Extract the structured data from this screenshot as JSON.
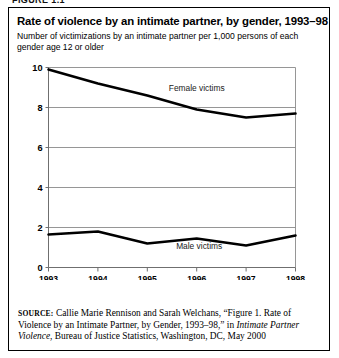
{
  "figure_header": "FIGURE 1.1",
  "figure": {
    "title": "Rate of violence by an intimate partner, by gender, 1993–98",
    "subtitle": "Number of victimizations by an intimate partner per 1,000 persons of each gender age 12 or older"
  },
  "source": {
    "kicker": "source:",
    "part1": " Callie Marie Rennison and Sarah Welchans, “Figure 1. Rate of Violence by an Intimate Partner, by Gender, 1993–98,” in ",
    "italic1": "Intimate Partner Violence",
    "part2": ", Bureau of Justice Statistics, Washington, DC, May 2000"
  },
  "chart_data": {
    "type": "line",
    "title": "Rate of violence by an intimate partner, by gender, 1993–98",
    "subtitle": "Number of victimizations by an intimate partner per 1,000 persons of each gender age 12 or older",
    "xlabel": "",
    "ylabel": "",
    "x": [
      1993,
      1994,
      1995,
      1996,
      1997,
      1998
    ],
    "categories": [
      "1993",
      "1994",
      "1995",
      "1996",
      "1997",
      "1998"
    ],
    "xlim": [
      1993,
      1998
    ],
    "ylim": [
      0,
      10
    ],
    "yticks": [
      0,
      2,
      4,
      6,
      8,
      10
    ],
    "ytick_labels": [
      "0",
      "2",
      "4",
      "6",
      "8",
      "10"
    ],
    "grid": "horizontal",
    "legend": "inline-annotations",
    "series": [
      {
        "name": "Female victims",
        "values": [
          9.9,
          9.2,
          8.6,
          7.9,
          7.5,
          7.7
        ],
        "color": "#000000"
      },
      {
        "name": "Male victims",
        "values": [
          1.65,
          1.8,
          1.2,
          1.45,
          1.1,
          1.6
        ],
        "color": "#000000"
      }
    ],
    "annotations": [
      {
        "text": "Female victims",
        "x": 1996.0,
        "y": 8.85
      },
      {
        "text": "Male victims",
        "x": 1996.05,
        "y": 0.95
      }
    ]
  },
  "colors": {
    "line": "#000000",
    "grid": "#8a8a8a",
    "axis": "#6f6f6f",
    "border": "#000000",
    "background": "#ffffff"
  }
}
